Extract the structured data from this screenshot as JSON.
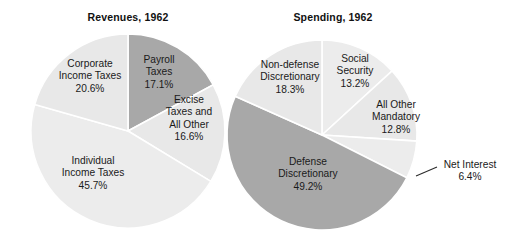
{
  "page": {
    "background_color": "#ffffff",
    "width": 509,
    "height": 249
  },
  "colors": {
    "light_slice": "#e8e8e8",
    "dark_slice": "#a8a8a8",
    "slice_border": "#ffffff",
    "text": "#1a1a1a",
    "leader_line": "#2b2b2b"
  },
  "chart_data": [
    {
      "type": "pie",
      "title": "Revenues, 1962",
      "xlabel": "",
      "ylabel": "",
      "legend_position": "none",
      "grid": false,
      "center": [
        128,
        131
      ],
      "radius": 97,
      "start_angle_deg": 0,
      "direction": "clockwise",
      "categories": [
        "Payroll Taxes",
        "Excise Taxes and All Other",
        "Individual Income Taxes",
        "Corporate Income Taxes"
      ],
      "values": [
        17.1,
        16.6,
        45.7,
        20.6
      ],
      "slices": [
        {
          "name": "Payroll Taxes",
          "label_lines": [
            "Payroll",
            "Taxes"
          ],
          "value_label": "17.1%",
          "value": 17.1,
          "color": "#a8a8a8",
          "label_x": 159,
          "label_y": 63,
          "label_anchor": "middle",
          "exploded": false
        },
        {
          "name": "Excise Taxes and All Other",
          "label_lines": [
            "Excise",
            "Taxes and",
            "All Other"
          ],
          "value_label": "16.6%",
          "value": 16.6,
          "color": "#e8e8e8",
          "label_x": 189,
          "label_y": 103,
          "label_anchor": "middle",
          "exploded": false
        },
        {
          "name": "Individual Income Taxes",
          "label_lines": [
            "Individual",
            "Income Taxes"
          ],
          "value_label": "45.7%",
          "value": 45.7,
          "color": "#ececec",
          "label_x": 93,
          "label_y": 164,
          "label_anchor": "middle",
          "exploded": false
        },
        {
          "name": "Corporate Income Taxes",
          "label_lines": [
            "Corporate",
            "Income Taxes"
          ],
          "value_label": "20.6%",
          "value": 20.6,
          "color": "#e8e8e8",
          "label_x": 90,
          "label_y": 67,
          "label_anchor": "middle",
          "exploded": false
        }
      ]
    },
    {
      "type": "pie",
      "title": "Spending, 1962",
      "xlabel": "",
      "ylabel": "",
      "legend_position": "none",
      "grid": false,
      "center": [
        322,
        135
      ],
      "radius": 95,
      "start_angle_deg": 0,
      "direction": "clockwise",
      "categories": [
        "Social Security",
        "All Other Mandatory",
        "Net Interest",
        "Defense Discretionary",
        "Non-defense Discretionary"
      ],
      "values": [
        13.2,
        12.8,
        6.4,
        49.2,
        18.3
      ],
      "slices": [
        {
          "name": "Social Security",
          "label_lines": [
            "Social",
            "Security"
          ],
          "value_label": "13.2%",
          "value": 13.2,
          "color": "#ececec",
          "label_x": 355,
          "label_y": 62,
          "label_anchor": "middle",
          "exploded": false
        },
        {
          "name": "All Other Mandatory",
          "label_lines": [
            "All Other",
            "Mandatory"
          ],
          "value_label": "12.8%",
          "value": 12.8,
          "color": "#e8e8e8",
          "label_x": 396,
          "label_y": 108,
          "label_anchor": "middle",
          "exploded": false
        },
        {
          "name": "Net Interest",
          "label_lines": [
            "Net Interest"
          ],
          "value_label": "6.4%",
          "value": 6.4,
          "color": "#ececec",
          "label_x": 470,
          "label_y": 168,
          "label_anchor": "middle",
          "exploded": false,
          "leader_line": {
            "from": [
              416,
              176
            ],
            "to": [
              437,
              167
            ]
          }
        },
        {
          "name": "Defense Discretionary",
          "label_lines": [
            "Defense",
            "Discretionary"
          ],
          "value_label": "49.2%",
          "value": 49.2,
          "color": "#a8a8a8",
          "label_x": 308,
          "label_y": 165,
          "label_anchor": "middle",
          "exploded": false
        },
        {
          "name": "Non-defense Discretionary",
          "label_lines": [
            "Non-defense",
            "Discretionary"
          ],
          "value_label": "18.3%",
          "value": 18.3,
          "color": "#e8e8e8",
          "label_x": 290,
          "label_y": 68,
          "label_anchor": "middle",
          "exploded": false
        }
      ]
    }
  ]
}
